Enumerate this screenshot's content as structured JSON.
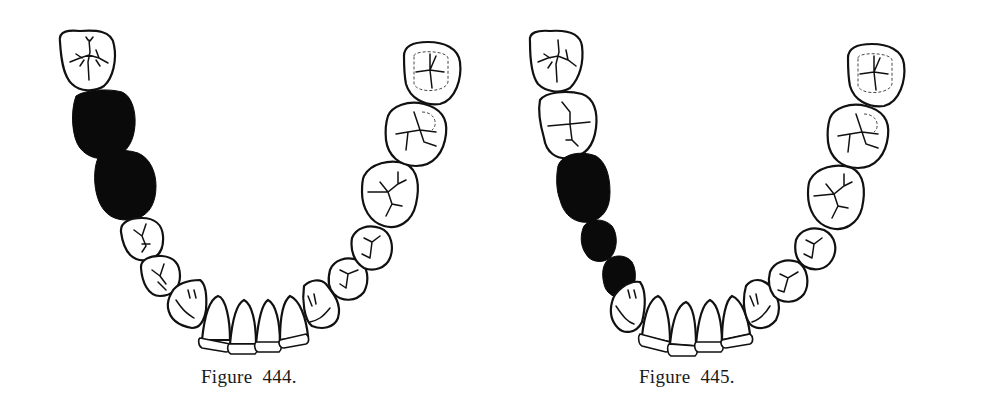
{
  "page": {
    "background": "#ffffff",
    "ink_color": "#111111"
  },
  "figures": [
    {
      "id": "left",
      "caption": "Figure 444.",
      "subject": "mandibular dental arch, occlusal view",
      "filled_teeth": [
        "right second molar",
        "right first molar"
      ],
      "teeth_count_visible": 14
    },
    {
      "id": "right",
      "caption": "Figure 445.",
      "subject": "mandibular dental arch, occlusal view",
      "filled_teeth": [
        "right first molar",
        "right second premolar",
        "right first premolar"
      ],
      "teeth_count_visible": 14
    }
  ]
}
